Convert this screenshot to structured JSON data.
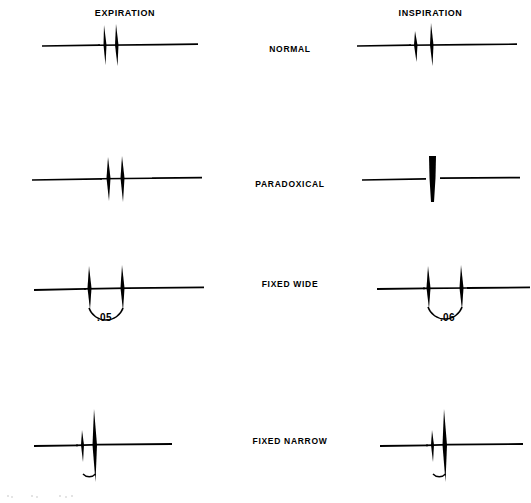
{
  "figure": {
    "column_headers": {
      "left": "EXPIRATION",
      "right": "INSPIRATION"
    },
    "ink_color": "#000000",
    "background_color": "#ffffff"
  },
  "rows": [
    {
      "label": "NORMAL",
      "expiration": {
        "interval_label": "",
        "has_interval_arc": false,
        "spike_count": 2,
        "description": "two closely spaced spikes, slight split"
      },
      "inspiration": {
        "interval_label": "",
        "has_interval_arc": false,
        "spike_count": 2,
        "description": "two spikes with wider split than expiration"
      }
    },
    {
      "label": "PARADOXICAL",
      "expiration": {
        "interval_label": "",
        "has_interval_arc": false,
        "spike_count": 2,
        "description": "two spikes, split present on expiration"
      },
      "inspiration": {
        "interval_label": "",
        "has_interval_arc": false,
        "spike_count": 1,
        "description": "single fused thick spike, split disappears"
      }
    },
    {
      "label": "FIXED WIDE",
      "expiration": {
        "interval_label": ".05",
        "has_interval_arc": true,
        "spike_count": 2,
        "description": "two widely separated spikes with interval bracket"
      },
      "inspiration": {
        "interval_label": ".06",
        "has_interval_arc": true,
        "spike_count": 2,
        "description": "two widely separated spikes with interval bracket"
      }
    },
    {
      "label": "FIXED NARROW",
      "expiration": {
        "interval_label": "",
        "has_interval_arc": true,
        "spike_count": 2,
        "description": "narrow split, small interval arc, tall second spike"
      },
      "inspiration": {
        "interval_label": "",
        "has_interval_arc": true,
        "spike_count": 2,
        "description": "narrow split, small interval arc, tall second spike"
      }
    }
  ]
}
